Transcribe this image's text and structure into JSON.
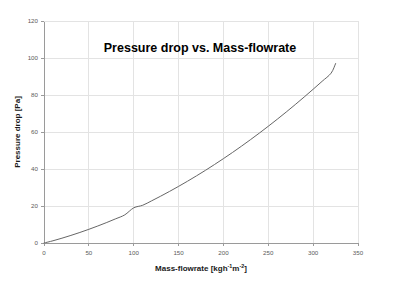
{
  "chart_data": {
    "type": "line",
    "title": "Pressure drop vs. Mass-flowrate",
    "xlabel_main": "Mass-flowrate [kgh",
    "xlabel_sup1": "-1",
    "xlabel_mid": "m",
    "xlabel_sup2": "-2",
    "xlabel_end": "]",
    "xlabel": "Mass-flowrate [kgh-1m-2]",
    "ylabel": "Pressure drop [Pa]",
    "xlim": [
      0,
      350
    ],
    "ylim": [
      0,
      120
    ],
    "xticks": [
      "0",
      "50",
      "100",
      "150",
      "200",
      "250",
      "300",
      "350"
    ],
    "yticks": [
      "0",
      "20",
      "40",
      "60",
      "80",
      "100",
      "120"
    ],
    "grid": true,
    "legend": "none",
    "series": [
      {
        "name": "Pressure drop",
        "color": "#666666",
        "x": [
          0,
          10,
          20,
          30,
          40,
          50,
          60,
          70,
          80,
          90,
          100,
          110,
          120,
          130,
          140,
          150,
          160,
          170,
          180,
          190,
          200,
          210,
          220,
          230,
          240,
          250,
          260,
          270,
          280,
          290,
          300,
          310,
          320,
          325
        ],
        "y": [
          0.0,
          1.2,
          2.6,
          4.1,
          5.7,
          7.4,
          9.2,
          11.1,
          13.1,
          15.2,
          19.0,
          20.4,
          22.8,
          25.3,
          27.9,
          30.6,
          33.4,
          36.3,
          39.3,
          42.4,
          45.6,
          48.9,
          52.3,
          55.8,
          59.4,
          63.1,
          66.9,
          70.8,
          74.8,
          78.9,
          83.1,
          87.4,
          91.8,
          97.0
        ]
      }
    ],
    "colors": {
      "grid": "#e3e3e3",
      "axis": "#9a9a9a",
      "curve": "#5e5e5e",
      "text": "#1a1a1a",
      "tick_text": "#5a5a5a",
      "background": "#ffffff"
    },
    "plot_area": {
      "left": 44,
      "top": 21,
      "right": 358,
      "bottom": 243
    }
  }
}
